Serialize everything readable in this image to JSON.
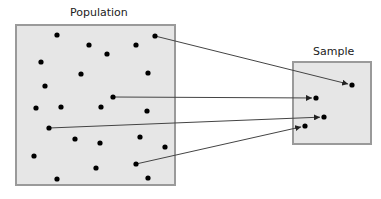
{
  "population": {
    "label": "Population",
    "box": {
      "x": 16,
      "y": 25,
      "w": 159,
      "h": 160
    },
    "dots": [
      [
        57,
        35
      ],
      [
        89,
        45
      ],
      [
        107,
        54
      ],
      [
        136,
        45
      ],
      [
        155,
        36
      ],
      [
        41,
        62
      ],
      [
        81,
        74
      ],
      [
        148,
        73
      ],
      [
        45,
        86
      ],
      [
        113,
        97
      ],
      [
        36,
        108
      ],
      [
        61,
        107
      ],
      [
        101,
        107
      ],
      [
        147,
        111
      ],
      [
        49,
        128
      ],
      [
        75,
        139
      ],
      [
        100,
        143
      ],
      [
        140,
        137
      ],
      [
        165,
        147
      ],
      [
        34,
        156
      ],
      [
        96,
        168
      ],
      [
        136,
        164
      ],
      [
        57,
        179
      ],
      [
        148,
        178
      ]
    ]
  },
  "sample": {
    "label": "Sample",
    "box": {
      "x": 293,
      "y": 62,
      "w": 78,
      "h": 82
    },
    "dots": [
      [
        352,
        85
      ],
      [
        316,
        98
      ],
      [
        324,
        117
      ],
      [
        305,
        126
      ]
    ]
  },
  "arrows": [
    {
      "from": [
        155,
        36
      ],
      "to": [
        352,
        85
      ]
    },
    {
      "from": [
        113,
        97
      ],
      "to": [
        316,
        98
      ]
    },
    {
      "from": [
        49,
        128
      ],
      "to": [
        324,
        117
      ]
    },
    {
      "from": [
        136,
        164
      ],
      "to": [
        305,
        126
      ]
    }
  ],
  "colors": {
    "box_fill": "#e6e6e6",
    "box_stroke": "#9a9a9a",
    "dot": "#000000",
    "line": "#444444"
  }
}
